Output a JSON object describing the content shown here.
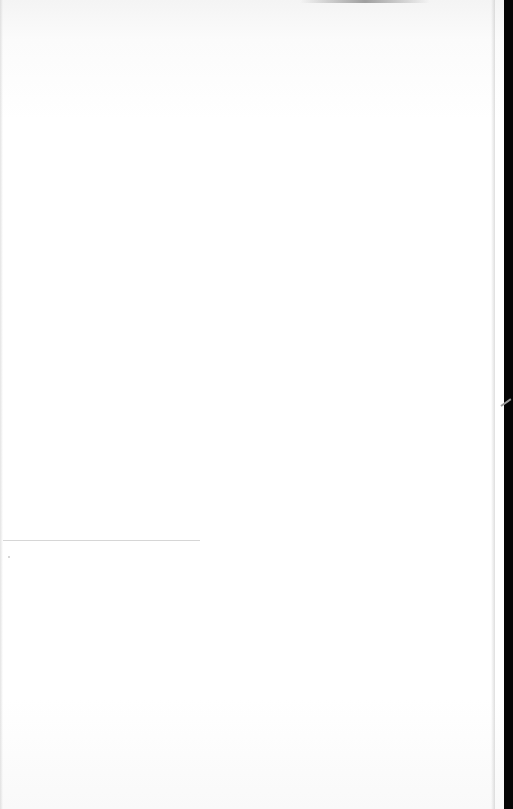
{
  "document": {
    "type": "blank scanned page",
    "text": "",
    "colors": {
      "paper": "#ffffff",
      "scanner_edge": "#050505",
      "rule_line": "#d6d6d6"
    }
  }
}
